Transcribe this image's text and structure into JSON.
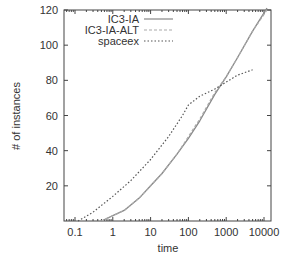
{
  "chart_data": {
    "type": "line",
    "title": "",
    "xlabel": "time",
    "ylabel": "# of instances",
    "xscale": "log",
    "xlim": [
      0.05,
      15000
    ],
    "ylim": [
      0,
      122
    ],
    "xticks": [
      0.1,
      1,
      10,
      100,
      1000,
      10000
    ],
    "xtick_labels": [
      "0.1",
      "1",
      "10",
      "100",
      "1000",
      "10000"
    ],
    "yticks": [
      20,
      40,
      60,
      80,
      100,
      120
    ],
    "ytick_labels": [
      "20",
      "40",
      "60",
      "80",
      "100",
      "120"
    ],
    "grid": false,
    "legend_position": "top-left-inside",
    "series": [
      {
        "name": "IC3-IA",
        "style": "solid",
        "color": "#888888",
        "points": [
          [
            0.5,
            0
          ],
          [
            1,
            3
          ],
          [
            2,
            6
          ],
          [
            5,
            13
          ],
          [
            10,
            20
          ],
          [
            20,
            27
          ],
          [
            50,
            38
          ],
          [
            100,
            47
          ],
          [
            200,
            57
          ],
          [
            500,
            72
          ],
          [
            1000,
            82
          ],
          [
            2000,
            93
          ],
          [
            5000,
            108
          ],
          [
            12000,
            121
          ]
        ]
      },
      {
        "name": "IC3-IA-ALT",
        "style": "dashed",
        "color": "#aaaaaa",
        "points": [
          [
            0.5,
            0
          ],
          [
            1,
            3
          ],
          [
            2,
            6
          ],
          [
            5,
            13
          ],
          [
            10,
            20
          ],
          [
            20,
            27
          ],
          [
            50,
            38
          ],
          [
            100,
            48
          ],
          [
            200,
            58
          ],
          [
            500,
            73
          ],
          [
            1000,
            82
          ],
          [
            2000,
            93
          ],
          [
            5000,
            108
          ],
          [
            12000,
            120
          ]
        ]
      },
      {
        "name": "spaceex",
        "style": "dotted",
        "color": "#555555",
        "points": [
          [
            0.12,
            0
          ],
          [
            0.3,
            5
          ],
          [
            1,
            14
          ],
          [
            3,
            23
          ],
          [
            10,
            35
          ],
          [
            30,
            48
          ],
          [
            70,
            60
          ],
          [
            100,
            66
          ],
          [
            200,
            71
          ],
          [
            500,
            75
          ],
          [
            1000,
            79
          ],
          [
            2000,
            83
          ],
          [
            5000,
            86
          ]
        ]
      }
    ]
  }
}
